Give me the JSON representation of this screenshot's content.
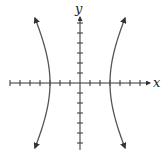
{
  "chart_data": {
    "type": "line",
    "title": "",
    "xlabel": "x",
    "ylabel": "y",
    "grid": false,
    "xlim": [
      -7,
      7
    ],
    "ylim": [
      -6.5,
      6.5
    ],
    "x_ticks": [
      -7,
      -6,
      -5,
      -4,
      -3,
      -2,
      -1,
      1,
      2,
      3,
      4,
      5,
      6
    ],
    "y_ticks": [
      -6,
      -5,
      -4,
      -3,
      -2,
      -1,
      1,
      2,
      3,
      4,
      5,
      6
    ],
    "tick_labels_shown": false,
    "vertices": [
      [
        -3,
        0
      ],
      [
        3,
        0
      ]
    ],
    "a": 3,
    "b": 5.8,
    "series": [
      {
        "name": "left-branch",
        "branch": -1,
        "y_range": [
          -6.5,
          6.5
        ],
        "arrows": "both"
      },
      {
        "name": "right-branch",
        "branch": 1,
        "y_range": [
          -6.5,
          6.5
        ],
        "arrows": "both"
      }
    ],
    "colors": {
      "curve": "#555555",
      "axis": "#333333"
    }
  },
  "labels": {
    "x_axis": "x",
    "y_axis": "y"
  }
}
